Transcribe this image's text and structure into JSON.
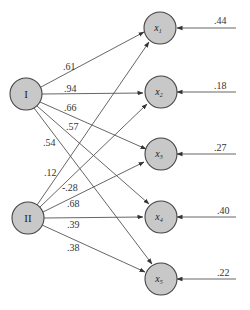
{
  "diagram": {
    "type": "factor-model-path-diagram",
    "colors": {
      "node_fill": "#c8c8c8",
      "node_stroke": "#444444",
      "line": "#555555",
      "background": "#ffffff"
    },
    "factors": [
      {
        "id": "I",
        "label": "I"
      },
      {
        "id": "II",
        "label": "II"
      }
    ],
    "indicators": [
      {
        "id": "x1",
        "label": "x",
        "sub": "1",
        "error": ".44"
      },
      {
        "id": "x2",
        "label": "x",
        "sub": "2",
        "error": ".18"
      },
      {
        "id": "x3",
        "label": "x",
        "sub": "3",
        "error": ".27"
      },
      {
        "id": "x4",
        "label": "x",
        "sub": "4",
        "error": ".40"
      },
      {
        "id": "x5",
        "label": "x",
        "sub": "5",
        "error": ".22"
      }
    ],
    "loadings": {
      "I": {
        "x1": ".61",
        "x2": ".94",
        "x3": ".66",
        "x4": ".57",
        "x5": ".54"
      },
      "II": {
        "x1": ".12",
        "x2": "-.28",
        "x3": ".68",
        "x4": ".39",
        "x5": ".38"
      }
    }
  }
}
